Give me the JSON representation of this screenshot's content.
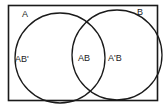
{
  "diagram": {
    "type": "venn",
    "universe_labels": {
      "left": "A",
      "right": "B"
    },
    "regions": {
      "left_only": "AB'",
      "intersection": "AB",
      "right_only": "A'B"
    },
    "colors": {
      "stroke": "#1a1a1a",
      "background": "#ffffff"
    }
  }
}
